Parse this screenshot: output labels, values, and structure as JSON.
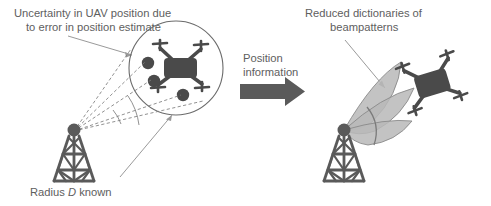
{
  "figure": {
    "background_color": "#ffffff",
    "stroke_color": "#6b6b6b",
    "drone_body_color": "#4a4a4a",
    "tower_color": "#5a5a5a",
    "lobe_fill_color": "#b4b4b4",
    "text_color": "#5e5e5e",
    "arrow_color": "#8a8a8a"
  },
  "labels": {
    "uncertainty_line1": "Uncertainty in UAV position due",
    "uncertainty_line2": "to error in position estimate",
    "radius_prefix": "Radius ",
    "radius_symbol": "D",
    "radius_suffix": " known",
    "position_info_line1": "Position",
    "position_info_line2": "information",
    "reduced_line1": "Reduced dictionaries of",
    "reduced_line2": "beampatterns"
  },
  "scene_left": {
    "tower_name": "base-station-tower-left",
    "circle_label": "uncertainty-region-circle",
    "uncertainty_dots": 3,
    "drone_label": "uav-drone-left",
    "dashed_rays": 4,
    "angle_arc": true
  },
  "scene_right": {
    "tower_name": "base-station-tower-right",
    "beam_lobes": 3,
    "drone_label": "uav-drone-right"
  },
  "transition": {
    "arrow_name": "position-information-arrow",
    "arrow_color": "#5a5a5a"
  }
}
